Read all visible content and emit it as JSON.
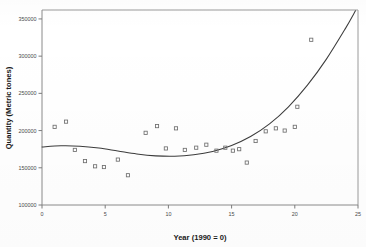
{
  "chart_data": {
    "type": "scatter",
    "title": "",
    "xlabel": "Year (1990 = 0)",
    "ylabel": "Quantity (Metric tones)",
    "xlim": [
      0,
      25
    ],
    "ylim": [
      100000,
      362000
    ],
    "xticks": [
      0,
      5,
      10,
      15,
      20,
      25
    ],
    "xtick_labels": [
      "0",
      "5",
      "10",
      "15",
      "20",
      "25"
    ],
    "yticks": [
      100000,
      150000,
      200000,
      250000,
      300000,
      350000
    ],
    "ytick_labels": [
      "100000",
      "150000",
      "200000",
      "250000",
      "300000",
      "350000"
    ],
    "grid": false,
    "legend": null,
    "marker_style": "open-square",
    "series": [
      {
        "name": "Observed quantity",
        "type": "scatter",
        "points": [
          {
            "x": 1.0,
            "y": 205000
          },
          {
            "x": 1.9,
            "y": 212000
          },
          {
            "x": 2.6,
            "y": 174000
          },
          {
            "x": 3.4,
            "y": 159000
          },
          {
            "x": 4.2,
            "y": 152000
          },
          {
            "x": 4.9,
            "y": 151000
          },
          {
            "x": 6.0,
            "y": 161000
          },
          {
            "x": 6.8,
            "y": 140000
          },
          {
            "x": 8.2,
            "y": 197000
          },
          {
            "x": 9.1,
            "y": 206000
          },
          {
            "x": 9.8,
            "y": 176000
          },
          {
            "x": 10.6,
            "y": 203000
          },
          {
            "x": 11.3,
            "y": 174000
          },
          {
            "x": 12.2,
            "y": 177000
          },
          {
            "x": 13.0,
            "y": 181000
          },
          {
            "x": 13.8,
            "y": 173000
          },
          {
            "x": 14.5,
            "y": 177000
          },
          {
            "x": 15.1,
            "y": 173000
          },
          {
            "x": 15.6,
            "y": 175000
          },
          {
            "x": 16.2,
            "y": 157000
          },
          {
            "x": 16.9,
            "y": 186000
          },
          {
            "x": 17.7,
            "y": 199000
          },
          {
            "x": 18.5,
            "y": 203000
          },
          {
            "x": 19.2,
            "y": 200000
          },
          {
            "x": 20.0,
            "y": 205000
          },
          {
            "x": 20.2,
            "y": 232000
          },
          {
            "x": 21.3,
            "y": 322000
          }
        ]
      },
      {
        "name": "Fitted cubic trend",
        "type": "line",
        "points": [
          {
            "x": 0.0,
            "y": 178000
          },
          {
            "x": 1.5,
            "y": 179500
          },
          {
            "x": 3.0,
            "y": 179000
          },
          {
            "x": 4.5,
            "y": 176500
          },
          {
            "x": 6.0,
            "y": 172500
          },
          {
            "x": 7.5,
            "y": 168500
          },
          {
            "x": 9.0,
            "y": 166000
          },
          {
            "x": 10.5,
            "y": 165500
          },
          {
            "x": 12.0,
            "y": 167500
          },
          {
            "x": 13.5,
            "y": 172000
          },
          {
            "x": 15.0,
            "y": 180000
          },
          {
            "x": 16.5,
            "y": 192000
          },
          {
            "x": 18.0,
            "y": 209000
          },
          {
            "x": 19.5,
            "y": 232000
          },
          {
            "x": 21.0,
            "y": 261000
          },
          {
            "x": 22.5,
            "y": 296000
          },
          {
            "x": 24.0,
            "y": 337000
          },
          {
            "x": 24.8,
            "y": 361000
          }
        ]
      }
    ]
  }
}
